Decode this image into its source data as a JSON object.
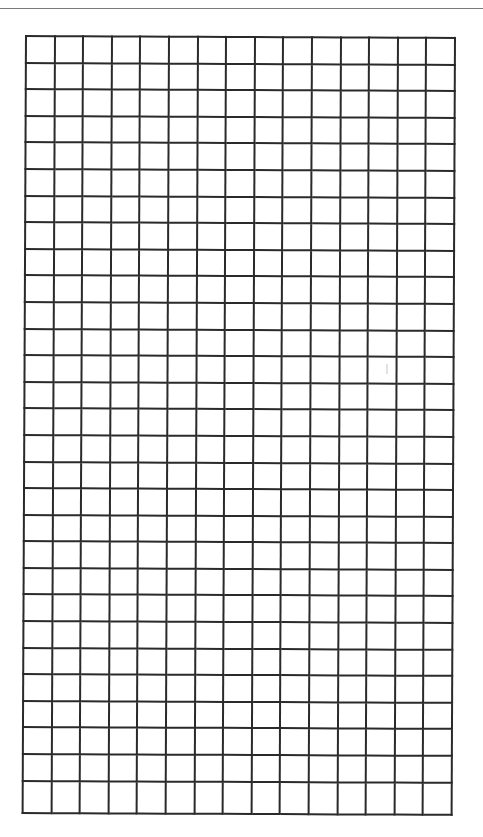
{
  "header": {
    "title_partial": "",
    "rule_color": "#7a7a7a"
  },
  "grid": {
    "columns": 15,
    "regular_rows": 28,
    "tall_bottom_rows": 1,
    "line_color": "#2a2a2a",
    "background": "#ffffff"
  }
}
